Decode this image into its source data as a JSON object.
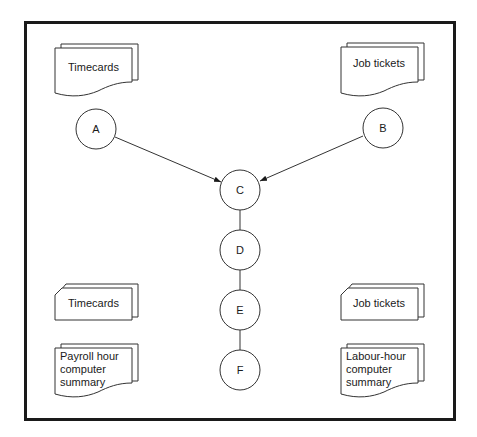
{
  "diagram": {
    "type": "system flowchart",
    "frame": {
      "stroke": "#1a1a1a"
    },
    "nodes": [
      {
        "id": "A",
        "label": "A",
        "cx": 96,
        "cy": 129
      },
      {
        "id": "B",
        "label": "B",
        "cx": 383,
        "cy": 128
      },
      {
        "id": "C",
        "label": "C",
        "cx": 240,
        "cy": 190
      },
      {
        "id": "D",
        "label": "D",
        "cx": 240,
        "cy": 250
      },
      {
        "id": "E",
        "label": "E",
        "cx": 240,
        "cy": 310
      },
      {
        "id": "F",
        "label": "F",
        "cx": 240,
        "cy": 370
      }
    ],
    "documents": {
      "top_left": {
        "shape": "multi-document",
        "label": "Timecards"
      },
      "top_right": {
        "shape": "multi-document",
        "label": "Job tickets"
      },
      "bottom_left_file": {
        "shape": "multi-card",
        "label": "Timecards"
      },
      "bottom_left_report": {
        "shape": "multi-document",
        "lines": [
          "Payroll hour",
          "computer",
          "summary"
        ]
      },
      "bottom_right_file": {
        "shape": "multi-card",
        "label": "Job tickets"
      },
      "bottom_right_report": {
        "shape": "multi-document",
        "lines": [
          "Labour-hour",
          "computer",
          "summary"
        ]
      }
    },
    "edges": [
      {
        "from": "A",
        "to": "C",
        "arrow": true
      },
      {
        "from": "B",
        "to": "C",
        "arrow": true
      },
      {
        "from": "C",
        "to": "D",
        "arrow": false
      },
      {
        "from": "D",
        "to": "E",
        "arrow": false
      },
      {
        "from": "E",
        "to": "F",
        "arrow": false
      }
    ]
  }
}
